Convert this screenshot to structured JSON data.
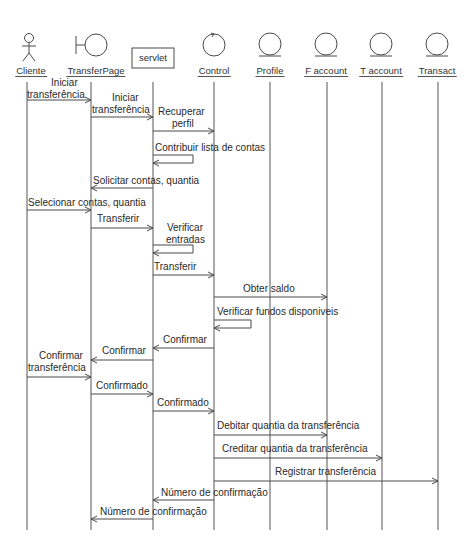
{
  "diagram": {
    "type": "UML sequence diagram",
    "colors": {
      "line": "#4a4a4a",
      "text": "#2a2a2a",
      "background": "#ffffff"
    },
    "objects": [
      {
        "id": "cliente",
        "name": "Cliente",
        "stereotype": "actor-icon",
        "x": 27
      },
      {
        "id": "transferpage",
        "name": "TransferPage",
        "stereotype": "boundary-icon",
        "x": 91
      },
      {
        "id": "servlet",
        "name": "servlet",
        "stereotype": "box",
        "x": 153
      },
      {
        "id": "control",
        "name": "Control",
        "stereotype": "control-icon",
        "x": 214
      },
      {
        "id": "profile",
        "name": "Profile",
        "stereotype": "entity-icon",
        "x": 270
      },
      {
        "id": "faccount",
        "name": "F account",
        "stereotype": "entity-icon",
        "x": 327
      },
      {
        "id": "taccount",
        "name": "T account",
        "stereotype": "entity-icon",
        "x": 382
      },
      {
        "id": "transact",
        "name": "Transact",
        "stereotype": "entity-icon",
        "x": 438
      }
    ],
    "messages": [
      {
        "label": "Iniciar transferência",
        "lines": [
          "Iniciar",
          "transferência"
        ],
        "from": "cliente",
        "to": "transferpage",
        "y": 100
      },
      {
        "label": "Iniciar transferência",
        "lines": [
          "Iniciar",
          "transferência"
        ],
        "from": "transferpage",
        "to": "servlet",
        "y": 117
      },
      {
        "label": "Recuperar perfil",
        "lines": [
          "Recuperar",
          "perfil"
        ],
        "from": "servlet",
        "to": "control",
        "y": 131
      },
      {
        "label": "Contribuir lista de contas",
        "lines": [
          "Contribuir lista de contas"
        ],
        "from": "servlet",
        "to": "servlet",
        "y": 155,
        "self": true
      },
      {
        "label": "Solicitar contas, quantia",
        "lines": [
          "Solicitar contas, quantia"
        ],
        "from": "servlet",
        "to": "transferpage",
        "y": 188
      },
      {
        "label": "Selecionar contas, quantia",
        "lines": [
          "Selecionar contas, quantia"
        ],
        "from": "cliente",
        "to": "transferpage",
        "y": 210
      },
      {
        "label": "Transferir",
        "lines": [
          "Transferir"
        ],
        "from": "transferpage",
        "to": "servlet",
        "y": 228
      },
      {
        "label": "Verificar entradas",
        "lines": [
          "Verificar",
          "entradas"
        ],
        "from": "servlet",
        "to": "servlet",
        "y": 245,
        "self": true
      },
      {
        "label": "Transferir",
        "lines": [
          "Transferir"
        ],
        "from": "servlet",
        "to": "control",
        "y": 275
      },
      {
        "label": "Obter saldo",
        "lines": [
          "Obter saldo"
        ],
        "from": "control",
        "to": "faccount",
        "y": 297
      },
      {
        "label": "Verificar fundos disponiveis",
        "lines": [
          "Verificar fundos disponiveis"
        ],
        "from": "control",
        "to": "control",
        "y": 320,
        "self": true
      },
      {
        "label": "Confirmar",
        "lines": [
          "Confirmar"
        ],
        "from": "control",
        "to": "servlet",
        "y": 348
      },
      {
        "label": "Confirmar",
        "lines": [
          "Confirmar"
        ],
        "from": "servlet",
        "to": "transferpage",
        "y": 360
      },
      {
        "label": "Confirmar transferência",
        "lines": [
          "Confirmar",
          "transferência"
        ],
        "from": "cliente",
        "to": "transferpage",
        "y": 377
      },
      {
        "label": "Confirmado",
        "lines": [
          "Confirmado"
        ],
        "from": "transferpage",
        "to": "servlet",
        "y": 394
      },
      {
        "label": "Confirmado",
        "lines": [
          "Confirmado"
        ],
        "from": "servlet",
        "to": "control",
        "y": 411
      },
      {
        "label": "Debitar quantia da transferência",
        "lines": [
          "Debitar quantia da transferência"
        ],
        "from": "control",
        "to": "faccount",
        "y": 435
      },
      {
        "label": "Creditar quantia da transferência",
        "lines": [
          "Creditar quantia da transferência"
        ],
        "from": "control",
        "to": "taccount",
        "y": 458
      },
      {
        "label": "Registrar transferência",
        "lines": [
          "Registrar transferência"
        ],
        "from": "control",
        "to": "transact",
        "y": 481
      },
      {
        "label": "Número de confirmação",
        "lines": [
          "Número de confirmação"
        ],
        "from": "control",
        "to": "servlet",
        "y": 500
      },
      {
        "label": "Número de confirmação",
        "lines": [
          "Número de confirmação"
        ],
        "from": "servlet",
        "to": "transferpage",
        "y": 519
      }
    ]
  }
}
